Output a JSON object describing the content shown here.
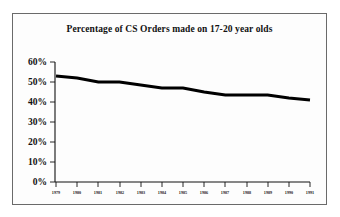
{
  "chart_data": {
    "type": "line",
    "title": "Percentage of CS Orders made on 17-20 year olds",
    "xlabel": "",
    "ylabel": "",
    "categories": [
      "1979",
      "1980",
      "1981",
      "1982",
      "1983",
      "1984",
      "1985",
      "1986",
      "1987",
      "1988",
      "1989",
      "1990",
      "1991"
    ],
    "values": [
      53,
      52,
      50,
      50,
      48.5,
      47,
      47,
      45,
      43.5,
      43.5,
      43.5,
      42,
      41
    ],
    "series": [
      {
        "name": "Percentage of CS Orders made on 17-20 year olds",
        "values": [
          53,
          52,
          50,
          50,
          48.5,
          47,
          47,
          45,
          43.5,
          43.5,
          43.5,
          42,
          41
        ]
      }
    ],
    "ylim": [
      0,
      60
    ],
    "yticks": [
      0,
      10,
      20,
      30,
      40,
      50,
      60
    ],
    "ytick_labels": [
      "0%",
      "10%",
      "20%",
      "30%",
      "40%",
      "50%",
      "60%"
    ],
    "grid": false,
    "legend": false,
    "legend_position": "none",
    "line_color": "#000000"
  },
  "axes": {
    "y_labels": [
      "60%",
      "50%",
      "40%",
      "30%",
      "20%",
      "10%",
      "0%"
    ],
    "x_labels": [
      "1979",
      "1980",
      "1981",
      "1982",
      "1983",
      "1984",
      "1985",
      "1986",
      "1987",
      "1988",
      "1989",
      "1990",
      "1991"
    ]
  },
  "figure": {
    "title": "Percentage of CS Orders made on 17-20 year olds"
  }
}
